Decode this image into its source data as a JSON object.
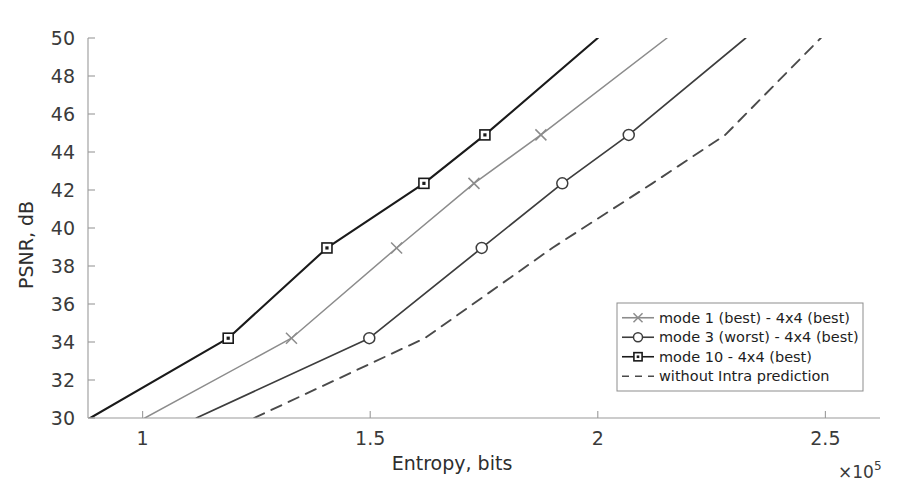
{
  "chart_data": {
    "type": "line",
    "title": "",
    "xlabel": "Entropy, bits",
    "ylabel": "PSNR, dB",
    "x_multiplier": "×10",
    "x_multiplier_exp": "5",
    "xlim": [
      0.88,
      2.62
    ],
    "ylim": [
      30,
      50
    ],
    "xticks": [
      1,
      1.5,
      2,
      2.5
    ],
    "xticklabels": [
      "1",
      "1.5",
      "2",
      "2.5"
    ],
    "yticks": [
      30,
      32,
      34,
      36,
      38,
      40,
      42,
      44,
      46,
      48,
      50
    ],
    "yticklabels": [
      "30",
      "32",
      "34",
      "36",
      "38",
      "40",
      "42",
      "44",
      "46",
      "48",
      "50"
    ],
    "grid": false,
    "legend_position": "center-right",
    "series": [
      {
        "name": "mode 10 - 4x4 (best)",
        "marker": "square",
        "linestyle": "solid",
        "color": "#1a1a1a",
        "linewidth": 2.1,
        "points": [
          {
            "x": 0.885,
            "y": 30.0
          },
          {
            "x": 1.188,
            "y": 34.2
          },
          {
            "x": 1.405,
            "y": 38.95
          },
          {
            "x": 1.618,
            "y": 42.35
          },
          {
            "x": 1.752,
            "y": 44.9
          },
          {
            "x": 2.0,
            "y": 50.0
          }
        ]
      },
      {
        "name": "mode 1 (best) - 4x4 (best)",
        "marker": "x",
        "linestyle": "solid",
        "color": "#8c8c8c",
        "linewidth": 1.5,
        "points": [
          {
            "x": 1.005,
            "y": 30.0
          },
          {
            "x": 1.327,
            "y": 34.2
          },
          {
            "x": 1.558,
            "y": 38.95
          },
          {
            "x": 1.728,
            "y": 42.35
          },
          {
            "x": 1.875,
            "y": 44.9
          },
          {
            "x": 2.152,
            "y": 50.0
          }
        ]
      },
      {
        "name": "mode 3 (worst) - 4x4 (best)",
        "marker": "circle",
        "linestyle": "solid",
        "color": "#3d3d3d",
        "linewidth": 1.7,
        "points": [
          {
            "x": 1.118,
            "y": 30.0
          },
          {
            "x": 1.498,
            "y": 34.2
          },
          {
            "x": 1.745,
            "y": 38.95
          },
          {
            "x": 1.922,
            "y": 42.35
          },
          {
            "x": 2.068,
            "y": 44.9
          },
          {
            "x": 2.325,
            "y": 50.0
          }
        ]
      },
      {
        "name": "without Intra prediction",
        "marker": "none",
        "linestyle": "dashed",
        "color": "#4a4a4a",
        "linewidth": 1.9,
        "points": [
          {
            "x": 1.245,
            "y": 30.0
          },
          {
            "x": 1.62,
            "y": 34.2
          },
          {
            "x": 1.9,
            "y": 38.95
          },
          {
            "x": 2.12,
            "y": 42.35
          },
          {
            "x": 2.28,
            "y": 44.9
          },
          {
            "x": 2.49,
            "y": 50.0
          }
        ]
      }
    ],
    "legend_entries": [
      {
        "label": "mode 1 (best) - 4x4 (best)",
        "marker": "x",
        "linestyle": "solid",
        "color": "#8c8c8c"
      },
      {
        "label": "mode 3 (worst) - 4x4 (best)",
        "marker": "circle",
        "linestyle": "solid",
        "color": "#3d3d3d"
      },
      {
        "label": "mode 10 - 4x4 (best)",
        "marker": "square",
        "linestyle": "solid",
        "color": "#1a1a1a"
      },
      {
        "label": "without Intra prediction",
        "marker": "none",
        "linestyle": "dashed",
        "color": "#4a4a4a"
      }
    ]
  }
}
